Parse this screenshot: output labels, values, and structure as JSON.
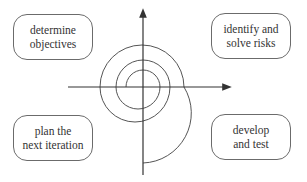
{
  "diagram": {
    "type": "spiral-model",
    "colors": {
      "line": "#444444",
      "box_border": "#6b6b6b",
      "text": "#333333",
      "background": "#ffffff"
    },
    "quadrants": {
      "top_left": {
        "line1": "determine",
        "line2": "objectives"
      },
      "top_right": {
        "line1": "identify and",
        "line2": "solve risks"
      },
      "bottom_left": {
        "line1": "plan the",
        "line2": "next iteration"
      },
      "bottom_right": {
        "line1": "develop",
        "line2": "and test"
      }
    },
    "axes": {
      "vertical": "arrow pointing up",
      "horizontal": "arrow pointing right"
    },
    "spiral": {
      "turns": 3,
      "direction": "clockwise, expanding outward from center"
    }
  }
}
